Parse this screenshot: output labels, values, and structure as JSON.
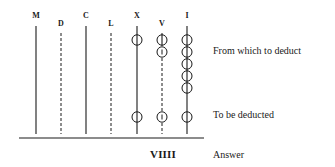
{
  "columns": [
    {
      "label": "M",
      "x": 36,
      "style": "solid",
      "label_y": 11
    },
    {
      "label": "D",
      "x": 61,
      "style": "dashed",
      "label_y": 19
    },
    {
      "label": "C",
      "x": 86,
      "style": "solid",
      "label_y": 11
    },
    {
      "label": "L",
      "x": 111,
      "style": "dashed",
      "label_y": 19
    },
    {
      "label": "X",
      "x": 137,
      "style": "solid",
      "label_y": 11
    },
    {
      "label": "V",
      "x": 162,
      "style": "dashed",
      "label_y": 19
    },
    {
      "label": "I",
      "x": 187,
      "style": "solid",
      "label_y": 11
    }
  ],
  "counters": {
    "X": [
      {
        "y": 40,
        "mark": "line"
      },
      {
        "y": 117,
        "mark": "line"
      }
    ],
    "V": [
      {
        "y": 40,
        "mark": "line"
      },
      {
        "y": 52,
        "mark": "I"
      },
      {
        "y": 117,
        "mark": "I"
      }
    ],
    "I": [
      {
        "y": 40,
        "mark": "line"
      },
      {
        "y": 52,
        "mark": "line"
      },
      {
        "y": 64,
        "mark": "line"
      },
      {
        "y": 76,
        "mark": "line"
      },
      {
        "y": 88,
        "mark": "line"
      },
      {
        "y": 117,
        "mark": "line"
      }
    ]
  },
  "rows": {
    "minuend_label": "From which to deduct",
    "subtrahend_label": "To be deducted",
    "answer_label": "Answer"
  },
  "answer_value": "VIIII",
  "colors": {
    "ink": "#1a1a1a",
    "background": "#ffffff"
  }
}
